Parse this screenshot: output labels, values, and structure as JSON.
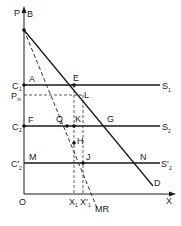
{
  "diagram": {
    "type": "economics-monopoly-cost-curves",
    "axes": {
      "y_label": "P",
      "x_label": "X",
      "origin_label": "O"
    },
    "price_levels": [
      {
        "axis_label": "C",
        "axis_sub": "1",
        "left_point": "A",
        "curve_label": "S",
        "curve_sub": "1"
      },
      {
        "axis_label": "P",
        "axis_sub": "m"
      },
      {
        "axis_label": "C",
        "axis_sub": "2",
        "left_point": "F",
        "curve_label": "S",
        "curve_sub": "2"
      },
      {
        "axis_label": "C'",
        "axis_sub": "2",
        "left_point": "M",
        "curve_label": "S'",
        "curve_sub": "2"
      }
    ],
    "curves": {
      "demand_label": "D",
      "marginal_revenue_label": "MR"
    },
    "points": {
      "B": "B",
      "E": "E",
      "L": "L",
      "Q": "Q",
      "K": "K",
      "G": "G",
      "H": "H",
      "J": "J",
      "N": "N"
    },
    "quantities": [
      {
        "label": "X",
        "sub": "1"
      },
      {
        "label": "X'",
        "sub": "1"
      }
    ]
  }
}
